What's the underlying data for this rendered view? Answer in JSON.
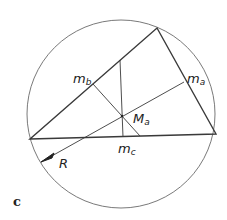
{
  "figure": {
    "panel_label": "c",
    "labels": {
      "m_b": {
        "main": "m",
        "sub": "b"
      },
      "m_a": {
        "main": "m",
        "sub": "a"
      },
      "m_c": {
        "main": "m",
        "sub": "c"
      },
      "circumcenter": {
        "main": "M",
        "sub": "a"
      },
      "radius": "R"
    },
    "colors": {
      "stroke": "#3a3a3a",
      "circle": "#6a6a6a",
      "background": "#ffffff"
    }
  }
}
